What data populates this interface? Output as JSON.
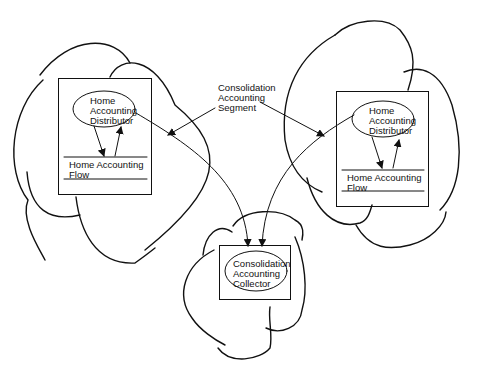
{
  "diagram": {
    "callout": {
      "lines": [
        "Consolidation",
        "Accounting",
        "Segment"
      ]
    },
    "left_node": {
      "distributor": [
        "Home",
        "Accounting",
        "Distributor"
      ],
      "flow": [
        "Home Accounting",
        "Flow"
      ]
    },
    "right_node": {
      "distributor": [
        "Home",
        "Accounting",
        "Distributor"
      ],
      "flow": [
        "Home Accounting",
        "Flow"
      ]
    },
    "bottom_node": {
      "collector": [
        "Consolidation",
        "Accounting",
        "Collector"
      ]
    },
    "colors": {
      "stroke": "#111111",
      "background": "#ffffff"
    }
  }
}
